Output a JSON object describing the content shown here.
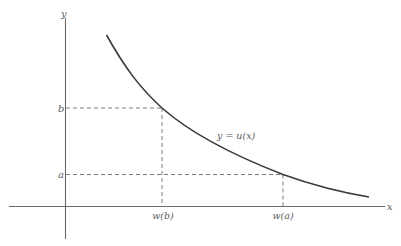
{
  "figure": {
    "axes": {
      "x_label": "x",
      "y_label": "y"
    },
    "curve": {
      "label": "y = u(x)",
      "description": "decreasing convex curve"
    },
    "levels": {
      "b": {
        "y_label": "b",
        "x_label": "w(b)"
      },
      "a": {
        "y_label": "a",
        "x_label": "w(a)"
      }
    },
    "colors": {
      "axis": "#6a6a6a",
      "curve": "#3a3a3a",
      "dashed": "#7a7a7a",
      "text": "#5a5a5a",
      "background": "#ffffff"
    }
  }
}
